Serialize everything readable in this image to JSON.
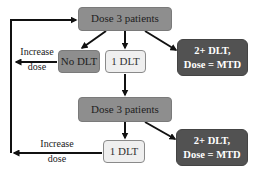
{
  "diagram": {
    "type": "flowchart",
    "title": "",
    "colors": {
      "dose_box": "#8e8e8e",
      "no_dlt_box": "#8e8e8e",
      "one_dlt_box": "#efefef",
      "mtd_box": "#525252",
      "arrow": "#111111"
    },
    "nodes": {
      "dose1": {
        "label": "Dose 3 patients"
      },
      "no_dlt": {
        "label": "No DLT"
      },
      "one_dlt_1": {
        "label": "1 DLT"
      },
      "mtd_1": {
        "line1": "2+ DLT,",
        "line2": "Dose = MTD"
      },
      "dose2": {
        "label": "Dose 3 patients"
      },
      "one_dlt_2": {
        "label": "1 DLT"
      },
      "mtd_2": {
        "line1": "2+ DLT,",
        "line2": "Dose = MTD"
      }
    },
    "edge_labels": {
      "increase_1": {
        "line1": "Increase",
        "line2": "dose"
      },
      "increase_2": {
        "line1": "Increase",
        "line2": "dose"
      }
    },
    "edges": [
      {
        "from": "dose1",
        "to": "no_dlt"
      },
      {
        "from": "dose1",
        "to": "one_dlt_1"
      },
      {
        "from": "dose1",
        "to": "mtd_1"
      },
      {
        "from": "no_dlt",
        "to": "dose1",
        "label": "Increase dose"
      },
      {
        "from": "one_dlt_1",
        "to": "dose2"
      },
      {
        "from": "dose2",
        "to": "one_dlt_2"
      },
      {
        "from": "dose2",
        "to": "mtd_2"
      },
      {
        "from": "one_dlt_2",
        "to": "dose1",
        "label": "Increase dose"
      }
    ]
  }
}
